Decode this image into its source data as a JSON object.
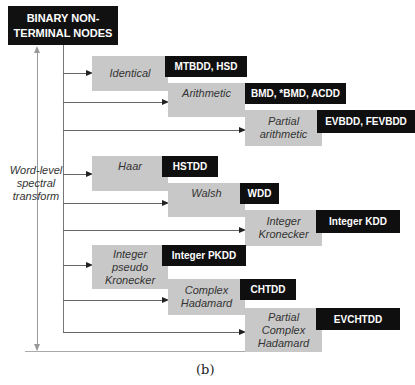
{
  "diagram": {
    "root": {
      "label_line1": "BINARY NON-",
      "label_line2": "TERMINAL NODES"
    },
    "side_label": {
      "line1": "Word-level",
      "line2": "spectral",
      "line3": "transform"
    },
    "caption": "(b)",
    "groups": [
      {
        "nodes": [
          {
            "lines": [
              "Identical"
            ],
            "tag": "MTBDD, HSD"
          },
          {
            "lines": [
              "Arithmetic"
            ],
            "tag": "BMD, *BMD, ACDD"
          },
          {
            "lines": [
              "Partial",
              "arithmetic"
            ],
            "tag": "EVBDD, FEVBDD"
          }
        ]
      },
      {
        "nodes": [
          {
            "lines": [
              "Haar"
            ],
            "tag": "HSTDD"
          },
          {
            "lines": [
              "Walsh"
            ],
            "tag": "WDD"
          },
          {
            "lines": [
              "Integer",
              "Kronecker"
            ],
            "tag": "Integer KDD"
          }
        ]
      },
      {
        "nodes": [
          {
            "lines": [
              "Integer",
              "pseudo",
              "Kronecker"
            ],
            "tag": "Integer PKDD"
          },
          {
            "lines": [
              "Complex",
              "Hadamard"
            ],
            "tag": "CHTDD"
          },
          {
            "lines": [
              "Partial",
              "Complex",
              "Hadamard"
            ],
            "tag": "EVCHTDD"
          }
        ]
      }
    ],
    "colors": {
      "tag_bg": "#0f0f0f",
      "node_bg": "#c8c8c8",
      "line": "#666666"
    }
  }
}
